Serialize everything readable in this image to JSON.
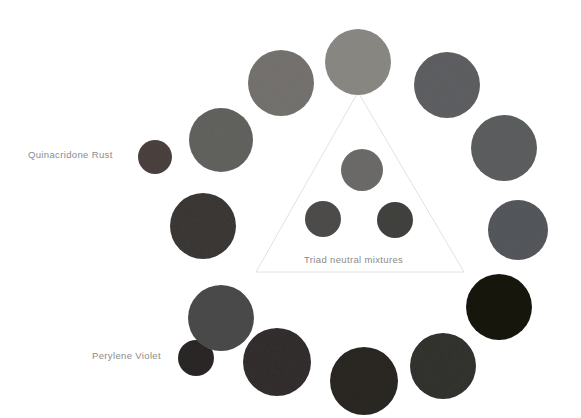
{
  "canvas": {
    "width": 581,
    "height": 418,
    "background": "#ffffff"
  },
  "labels": {
    "quinacridone_rust": "Quinacridone Rust",
    "perylene_violet": "Perylene Violet",
    "triad_neutral_mixtures": "Triad neutral mixtures",
    "text_color": "#8a8a8a"
  },
  "triangle": {
    "stroke": "#e2e2e2",
    "stroke_width": 1,
    "apex": {
      "x": 358,
      "y": 92
    },
    "left": {
      "x": 256,
      "y": 272
    },
    "right": {
      "x": 464,
      "y": 272
    }
  },
  "chart_data": {
    "type": "scatter",
    "title": "Triad neutral mixtures",
    "xlabel": "",
    "ylabel": "",
    "grid": false,
    "legend": "none",
    "swatches": [
      {
        "name": "quinacridone-rust-chip",
        "group": "outer-ring",
        "cx": 155,
        "cy": 157,
        "r": 17,
        "color": "#4b4340",
        "label": "Quinacridone Rust"
      },
      {
        "name": "outer-ring-upper-left",
        "group": "outer-ring",
        "cx": 221,
        "cy": 140,
        "r": 32,
        "color": "#646361"
      },
      {
        "name": "outer-ring-top-left",
        "group": "outer-ring",
        "cx": 281,
        "cy": 83,
        "r": 33,
        "color": "#767370"
      },
      {
        "name": "outer-ring-top",
        "group": "outer-ring",
        "cx": 358,
        "cy": 62,
        "r": 33,
        "color": "#8b8a85"
      },
      {
        "name": "outer-ring-top-right",
        "group": "outer-ring",
        "cx": 447,
        "cy": 85,
        "r": 33,
        "color": "#5f6063"
      },
      {
        "name": "outer-ring-upper-right",
        "group": "outer-ring",
        "cx": 504,
        "cy": 148,
        "r": 33,
        "color": "#5d5e61"
      },
      {
        "name": "outer-ring-right",
        "group": "outer-ring",
        "cx": 518,
        "cy": 230,
        "r": 30,
        "color": "#55585b"
      },
      {
        "name": "outer-ring-lower-right",
        "group": "outer-ring",
        "cx": 499,
        "cy": 307,
        "r": 33,
        "color": "#15120f"
      },
      {
        "name": "outer-ring-bottom-right",
        "group": "outer-ring",
        "cx": 443,
        "cy": 366,
        "r": 33,
        "color": "#33302f"
      },
      {
        "name": "outer-ring-bottom",
        "group": "outer-ring",
        "cx": 364,
        "cy": 381,
        "r": 34,
        "color": "#2c2523"
      },
      {
        "name": "outer-ring-bottom-left",
        "group": "outer-ring",
        "cx": 277,
        "cy": 362,
        "r": 34,
        "color": "#332f2f"
      },
      {
        "name": "perylene-violet-chip",
        "group": "outer-ring",
        "cx": 196,
        "cy": 358,
        "r": 18,
        "color": "#2b2725",
        "label": "Perylene Violet"
      },
      {
        "name": "outer-ring-lower-left",
        "group": "outer-ring",
        "cx": 221,
        "cy": 318,
        "r": 33,
        "color": "#4c4b4b"
      },
      {
        "name": "outer-ring-left",
        "group": "outer-ring",
        "cx": 203,
        "cy": 226,
        "r": 33,
        "color": "#3b3836"
      },
      {
        "name": "triad-neutral-top",
        "group": "triad-neutral",
        "cx": 362,
        "cy": 170,
        "r": 21,
        "color": "#6d6c6a"
      },
      {
        "name": "triad-neutral-bottom-left",
        "group": "triad-neutral",
        "cx": 323,
        "cy": 219,
        "r": 18,
        "color": "#4f4d4c"
      },
      {
        "name": "triad-neutral-bottom-right",
        "group": "triad-neutral",
        "cx": 395,
        "cy": 220,
        "r": 18,
        "color": "#434241"
      }
    ]
  }
}
